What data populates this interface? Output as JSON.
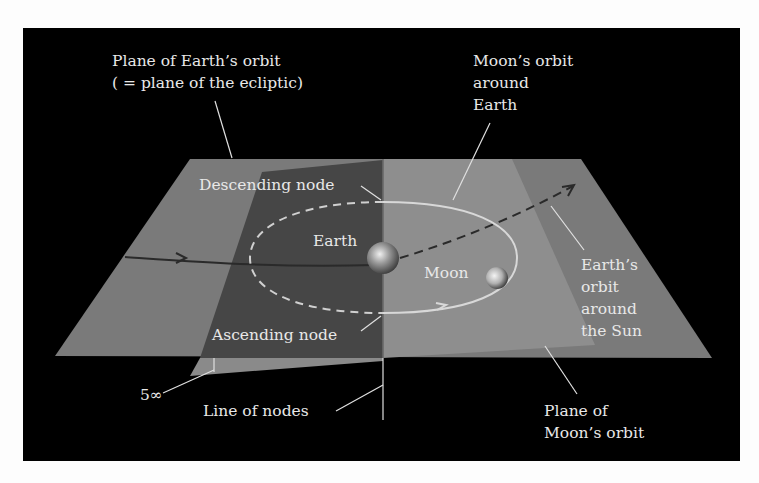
{
  "diagram": {
    "colors": {
      "background": "#000000",
      "page": "#fdfdfd",
      "ecliptic_plane": "#7a7a7a",
      "moon_plane_front": "#8c8c8c",
      "moon_plane_back": "#4a4a4a",
      "orbit_line": "#d8d8d8",
      "earth_orbit_line": "#2a2a2a",
      "label_text": "#e8e8e8"
    },
    "labels": {
      "ecliptic_line1": "Plane of Earth’s orbit",
      "ecliptic_line2": "( = plane of the ecliptic)",
      "moon_orbit_line1": "Moon’s orbit",
      "moon_orbit_line2": "around",
      "moon_orbit_line3": "Earth",
      "descending_node": "Descending node",
      "ascending_node": "Ascending node",
      "earth": "Earth",
      "moon": "Moon",
      "earth_orbit_sun_line1": "Earth’s",
      "earth_orbit_sun_line2": "orbit",
      "earth_orbit_sun_line3": "around",
      "earth_orbit_sun_line4": "the Sun",
      "inclination": "5∞",
      "line_of_nodes": "Line of nodes",
      "moon_plane_line1": "Plane of",
      "moon_plane_line2": "Moon’s orbit"
    }
  }
}
